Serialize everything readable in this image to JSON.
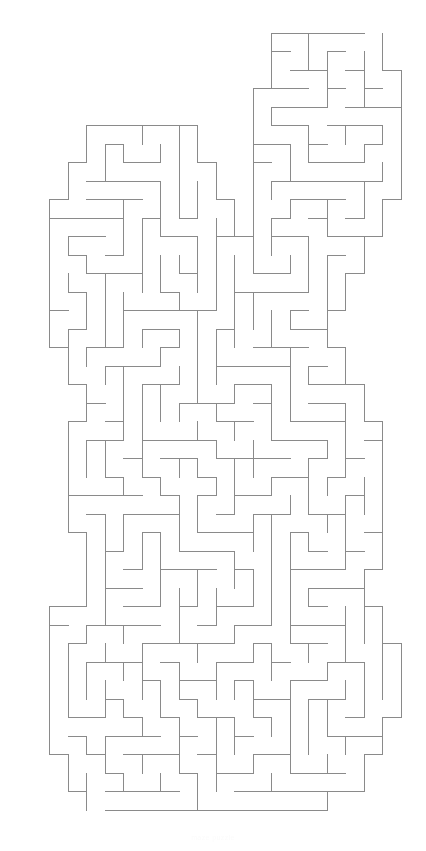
{
  "page": {
    "width": 426,
    "height": 851,
    "background_color": "#ffffff"
  },
  "maze": {
    "shape_name": "rabbit",
    "type": "perfect-maze",
    "wall_color": "#8a8a8a",
    "wall_width": 1,
    "cell_size": 18.5,
    "origin_x": 30.5,
    "origin_y": 32.5,
    "cols": 20,
    "rows": 42,
    "entrance_label": "top of right ear",
    "exit_label": "bottom of body",
    "seed": 20240417,
    "mask_rows": [
      "00000000000001111110",
      "00000000000001111110",
      "00000000000001111111",
      "00000000000011111111",
      "00000000000011111111",
      "00011111100011111111",
      "00011111100011111111",
      "00111111110011111111",
      "00111111110011111111",
      "01111111111011111110",
      "01111111111011111110",
      "01111111111111111100",
      "01111111111111111100",
      "01111111111111111000",
      "01111111111111111000",
      "01111111111111110000",
      "01111111111111110000",
      "00111111111111111000",
      "00111111111111111000",
      "00011111111111111100",
      "00011111111111111100",
      "00111111111111111110",
      "00111111111111111110",
      "00111111111111111110",
      "00111111111111111110",
      "00111111111111111110",
      "00111111111111111110",
      "00011111111111111110",
      "00011111111111111110",
      "00011111111111111100",
      "00011111111111111100",
      "01111111111111111110",
      "01111111111111111110",
      "01111111111111111111",
      "01111111111111111111",
      "01111111111111111111",
      "01111111111111111111",
      "01111111111111111110",
      "01111111111111111110",
      "00111111111111111100",
      "00111111111111111100",
      "00011111111111110000"
    ]
  },
  "caption": {
    "text": "maze puzzle"
  }
}
